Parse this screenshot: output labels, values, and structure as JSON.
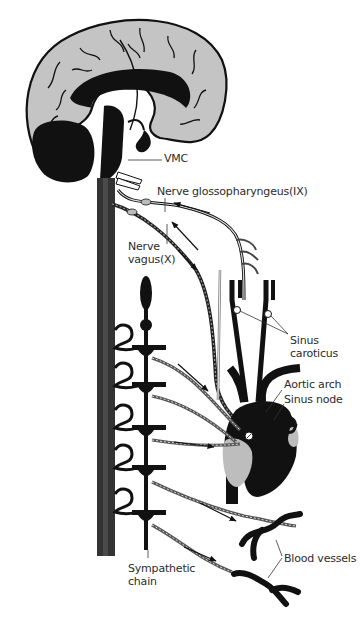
{
  "diagram": {
    "colors": {
      "background": "#ffffff",
      "brain_cortex": "#c4c4c4",
      "dark_structure": "#111111",
      "spinal_cord": "#333333",
      "heart_light": "#bdbdbd",
      "nerve_fill": "#9a9a9a",
      "text": "#2b2b2b"
    },
    "labels": {
      "vmc": "VMC",
      "glossopharyngeus": "Nerve glossopharyngeus(IX)",
      "vagus": "Nerve\nvagus(X)",
      "sinus_caroticus": "Sinus\ncaroticus",
      "aortic_arch": "Aortic arch",
      "sinus_node": "Sinus node",
      "blood_vessels": "Blood vessels",
      "sympathetic_chain": "Sympathetic\nchain"
    },
    "structures": [
      "brain",
      "vasomotor-center",
      "spinal-cord",
      "sympathetic-chain",
      "glossopharyngeal-nerve",
      "vagus-nerve",
      "carotid-arteries",
      "aortic-arch",
      "heart",
      "blood-vessels"
    ],
    "arrows": {
      "afferent_glossopharyngeal": "toward brain",
      "afferent_vagus": "toward brain",
      "efferent_vagus": "toward heart",
      "sympathetic_to_heart": "toward heart",
      "sympathetic_to_vessels": "toward blood vessels"
    }
  }
}
